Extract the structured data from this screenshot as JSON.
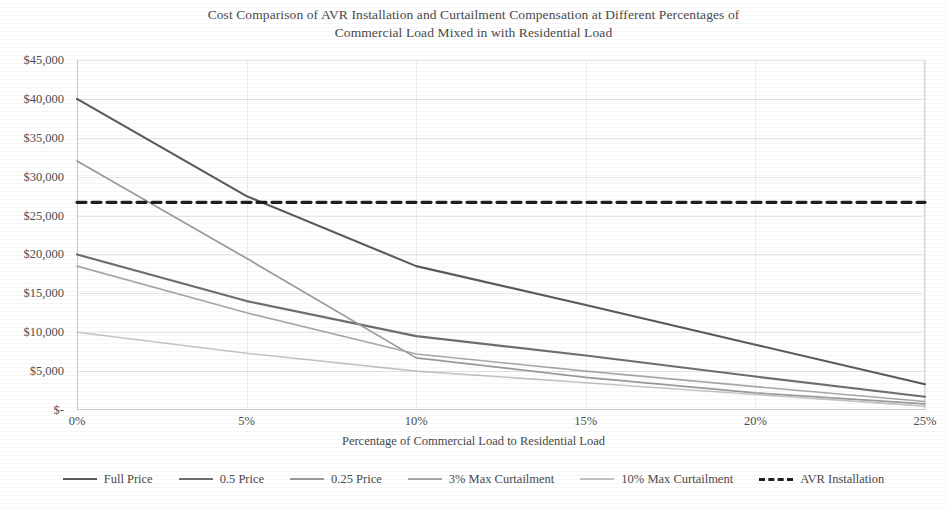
{
  "chart_data": {
    "type": "line",
    "title": "Cost Comparison of AVR Installation and Curtailment Compensation at Different Percentages of Commercial Load Mixed in with Residential Load",
    "title_line1": "Cost Comparison of AVR Installation and Curtailment Compensation at Different Percentages of",
    "title_line2": "Commercial Load Mixed in with Residential Load",
    "xlabel": "Percentage of Commercial Load to Residential Load",
    "ylabel": "",
    "xlim": [
      0,
      25
    ],
    "ylim": [
      0,
      45000
    ],
    "grid": true,
    "legend_position": "bottom",
    "x": [
      0,
      5,
      10,
      15,
      20,
      25
    ],
    "xtick_labels": [
      "0%",
      "5%",
      "10%",
      "15%",
      "20%",
      "25%"
    ],
    "ytick_labels": [
      "$45,000",
      "$40,000",
      "$35,000",
      "$30,000",
      "$25,000",
      "$20,000",
      "$15,000",
      "$10,000",
      "$5,000",
      "$-"
    ],
    "ytick_values": [
      45000,
      40000,
      35000,
      30000,
      25000,
      20000,
      15000,
      10000,
      5000,
      0
    ],
    "series": [
      {
        "name": "Full Price",
        "color": "#5a5a5a",
        "width": 2.1,
        "dash": "none",
        "values": [
          40000,
          27500,
          18500,
          13500,
          8400,
          3300
        ]
      },
      {
        "name": "0.5 Price",
        "color": "#6e6e6e",
        "width": 2.1,
        "dash": "none",
        "values": [
          20000,
          14000,
          9500,
          7000,
          4300,
          1700
        ]
      },
      {
        "name": "0.25 Price",
        "color": "#9a9a9a",
        "width": 1.7,
        "dash": "none",
        "values": [
          32000,
          19500,
          6700,
          4200,
          2200,
          800
        ]
      },
      {
        "name": "3% Max Curtailment",
        "color": "#a8a8a8",
        "width": 1.6,
        "dash": "none",
        "values": [
          18500,
          12500,
          7200,
          5000,
          3000,
          1100
        ]
      },
      {
        "name": "10% Max Curtailment",
        "color": "#c4c4c4",
        "width": 1.6,
        "dash": "none",
        "values": [
          10000,
          7300,
          5000,
          3500,
          2000,
          500
        ]
      },
      {
        "name": "AVR Installation",
        "color": "#1f1f1f",
        "width": 3.2,
        "dash": "9 6",
        "values": [
          26700,
          26700,
          26700,
          26700,
          26700,
          26700
        ]
      }
    ]
  }
}
